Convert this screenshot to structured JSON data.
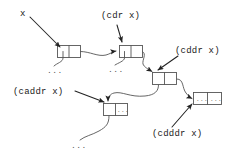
{
  "diagram": {
    "background_color": "#ffffff",
    "line_color": "#333333",
    "text_color": "#1a1a1a",
    "width": 233,
    "height": 156,
    "labels": [
      {
        "id": "x",
        "text": "x",
        "x": 20,
        "y": 10
      },
      {
        "id": "cdr",
        "text": "(cdr x)",
        "x": 101,
        "y": 12
      },
      {
        "id": "cddr",
        "text": "(cddr x)",
        "x": 175,
        "y": 47
      },
      {
        "id": "caddr",
        "text": "(caddr x)",
        "x": 13,
        "y": 88
      },
      {
        "id": "cdddr",
        "text": "(cdddr x)",
        "x": 152,
        "y": 130
      }
    ],
    "cells": [
      {
        "id": "cell1",
        "x": 57,
        "y": 45,
        "w": 24,
        "h": 13,
        "car": "",
        "cdr": ""
      },
      {
        "id": "cell2",
        "x": 119,
        "y": 45,
        "w": 24,
        "h": 13,
        "car": "",
        "cdr": ""
      },
      {
        "id": "cell3",
        "x": 152,
        "y": 72,
        "w": 25,
        "h": 13,
        "car": "",
        "cdr": ""
      },
      {
        "id": "cell4",
        "x": 103,
        "y": 103,
        "w": 25,
        "h": 13,
        "car": "",
        "cdr": "..."
      },
      {
        "id": "cell5",
        "x": 193,
        "y": 92,
        "w": 29,
        "h": 13,
        "car": "...",
        "cdr": "..."
      }
    ],
    "ellipses": [
      {
        "id": "dots-cell1",
        "text": "...",
        "x": 47,
        "y": 68
      },
      {
        "id": "dots-cell2",
        "text": "...",
        "x": 108,
        "y": 67
      },
      {
        "id": "dots-cell4",
        "text": "...",
        "x": 71,
        "y": 143
      }
    ],
    "pointers": [
      {
        "from": "x-label",
        "to": "cell1-car"
      },
      {
        "from": "cdr-label",
        "to": "cell2-car"
      },
      {
        "from": "cddr-label",
        "to": "cell3-top"
      },
      {
        "from": "caddr-label",
        "to": "cell4-car"
      },
      {
        "from": "cdddr-label",
        "to": "cell5-left"
      },
      {
        "from": "cell1-cdr",
        "to": "cell2-left"
      },
      {
        "from": "cell2-cdr",
        "to": "cell3-top"
      },
      {
        "from": "cell3-car",
        "to": "cell4-top"
      },
      {
        "from": "cell3-cdr",
        "to": "cell5-left"
      },
      {
        "from": "cell1-car",
        "to": "dots-cell1"
      },
      {
        "from": "cell2-car",
        "to": "dots-cell2"
      },
      {
        "from": "cell4-car",
        "to": "dots-cell4"
      }
    ]
  }
}
